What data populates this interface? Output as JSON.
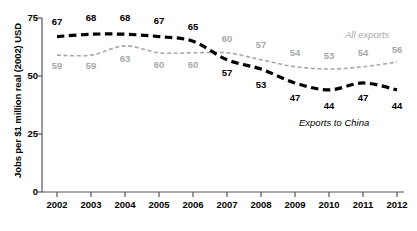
{
  "chart_data": {
    "type": "line",
    "title": "",
    "xlabel": "",
    "ylabel": "Jobs per $1 million real (2002) USD",
    "categories": [
      "2002",
      "2003",
      "2004",
      "2005",
      "2006",
      "2007",
      "2008",
      "2009",
      "2010",
      "2011",
      "2012"
    ],
    "x": [
      2002,
      2003,
      2004,
      2005,
      2006,
      2007,
      2008,
      2009,
      2010,
      2011,
      2012
    ],
    "ylim": [
      0,
      75
    ],
    "yticks": [
      "0",
      "25",
      "50",
      "75"
    ],
    "ytick_values": [
      0,
      25,
      50,
      75
    ],
    "grid": false,
    "legend_position": "inline-annotation",
    "series": [
      {
        "name": "Exports to China",
        "values": [
          67,
          68,
          68,
          67,
          65,
          57,
          53,
          47,
          44,
          47,
          44
        ],
        "color": "#000000",
        "style": "thick-dashed",
        "label_color": "#000000"
      },
      {
        "name": "All exports",
        "values": [
          59,
          59,
          63,
          60,
          60,
          60,
          57,
          54,
          53,
          54,
          56
        ],
        "color": "#a8a8a8",
        "style": "thin-dashed",
        "label_color": "#a8a8a8"
      }
    ],
    "annotations": [
      {
        "text": "All exports",
        "series": "All exports",
        "color": "#a8a8a8"
      },
      {
        "text": "Exports to China",
        "series": "Exports to China",
        "color": "#000000"
      }
    ]
  },
  "axes": {
    "y_title": "Jobs per $1 million real (2002) USD",
    "y_tick_0": "0",
    "y_tick_25": "25",
    "y_tick_50": "50",
    "y_tick_75": "75"
  },
  "labels": {
    "china": [
      "67",
      "68",
      "68",
      "67",
      "65",
      "57",
      "53",
      "47",
      "44",
      "47",
      "44"
    ],
    "allexp": [
      "59",
      "59",
      "63",
      "60",
      "60",
      "60",
      "57",
      "54",
      "53",
      "54",
      "56"
    ],
    "tag_allexp": "All exports",
    "tag_china": "Exports to China"
  },
  "xaxis": {
    "years": [
      "2002",
      "2003",
      "2004",
      "2005",
      "2006",
      "2007",
      "2008",
      "2009",
      "2010",
      "2011",
      "2012"
    ]
  },
  "colors": {
    "china_line": "#000000",
    "allexp_line": "#a8a8a8",
    "axis": "#555555",
    "background": "#ffffff"
  }
}
